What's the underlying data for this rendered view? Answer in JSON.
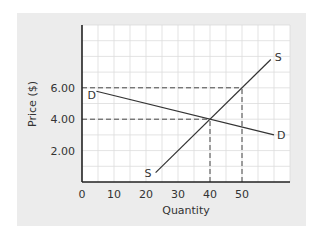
{
  "chart_data": {
    "type": "line",
    "title": "",
    "xlabel": "Quantity",
    "ylabel": "Price ($)",
    "xlim": [
      0,
      65
    ],
    "ylim": [
      0,
      10
    ],
    "grid": true,
    "x_ticks": [
      {
        "value": 0,
        "label": "0"
      },
      {
        "value": 10,
        "label": "10"
      },
      {
        "value": 20,
        "label": "20"
      },
      {
        "value": 30,
        "label": "30"
      },
      {
        "value": 40,
        "label": "40"
      },
      {
        "value": 50,
        "label": "50"
      }
    ],
    "y_ticks": [
      {
        "value": 2,
        "label": "2.00"
      },
      {
        "value": 4,
        "label": "4.00"
      },
      {
        "value": 6,
        "label": "6.00"
      }
    ],
    "series": [
      {
        "name": "D",
        "start_label": "D",
        "end_label": "D",
        "points": [
          [
            4.5,
            5.78
          ],
          [
            60,
            3.0
          ]
        ]
      },
      {
        "name": "S",
        "start_label": "S",
        "end_label": "S",
        "points": [
          [
            23,
            0.6
          ],
          [
            59,
            7.8
          ]
        ]
      }
    ],
    "reference_lines": [
      {
        "name": "price-6",
        "from": [
          0,
          6
        ],
        "to": [
          50,
          6
        ]
      },
      {
        "name": "price-4",
        "from": [
          0,
          4
        ],
        "to": [
          40,
          4
        ]
      },
      {
        "name": "quantity-40",
        "from": [
          40,
          0
        ],
        "to": [
          40,
          4
        ]
      },
      {
        "name": "quantity-50",
        "from": [
          50,
          0
        ],
        "to": [
          50,
          6
        ]
      }
    ],
    "colors": {
      "panel": "#ececec",
      "plot": "#ffffff",
      "grid": "#dcdcdc",
      "line": "#333333"
    }
  }
}
